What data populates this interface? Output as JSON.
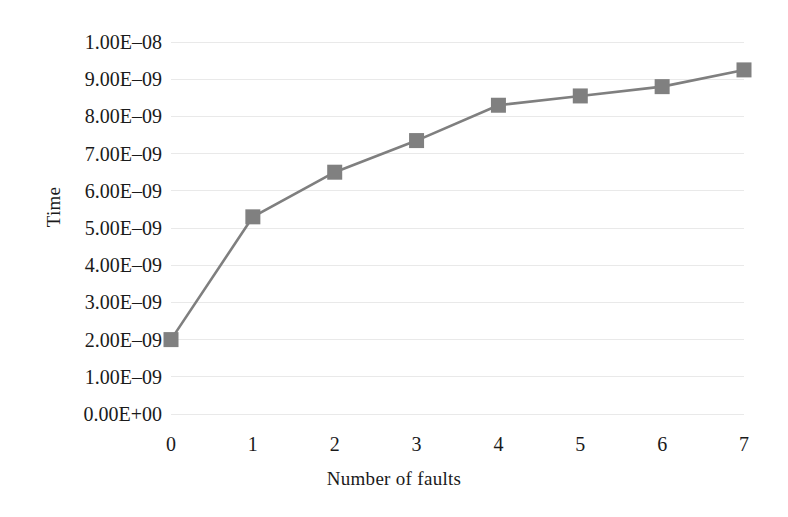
{
  "chart_data": {
    "type": "line",
    "title": "",
    "xlabel": "Number of faults",
    "ylabel": "Time",
    "x": [
      0,
      1,
      2,
      3,
      4,
      5,
      6,
      7
    ],
    "xtick_labels": [
      "0",
      "1",
      "2",
      "3",
      "4",
      "5",
      "6",
      "7"
    ],
    "values": [
      2e-09,
      5.3e-09,
      6.5e-09,
      7.35e-09,
      8.3e-09,
      8.55e-09,
      8.8e-09,
      9.25e-09
    ],
    "series": [
      {
        "name": "Time",
        "values": [
          2e-09,
          5.3e-09,
          6.5e-09,
          7.35e-09,
          8.3e-09,
          8.55e-09,
          8.8e-09,
          9.25e-09
        ]
      }
    ],
    "ylim": [
      0,
      1e-08
    ],
    "xlim": [
      0,
      7
    ],
    "ytick_values": [
      1e-08,
      9e-09,
      8e-09,
      7e-09,
      6e-09,
      5e-09,
      4e-09,
      3e-09,
      2e-09,
      1e-09,
      0
    ],
    "ytick_labels": [
      "1.00E–08",
      "9.00E–09",
      "8.00E–09",
      "7.00E–09",
      "6.00E–09",
      "5.00E–09",
      "4.00E–09",
      "3.00E–09",
      "2.00E–09",
      "1.00E–09",
      "0.00E+00"
    ],
    "grid": true,
    "grid_axis": "y",
    "legend": false,
    "legend_position": "none",
    "marker": "square",
    "marker_color": "#808080",
    "line_color": "#7f7f7f",
    "grid_color": "#e9e9e9",
    "background_color": "#ffffff"
  }
}
